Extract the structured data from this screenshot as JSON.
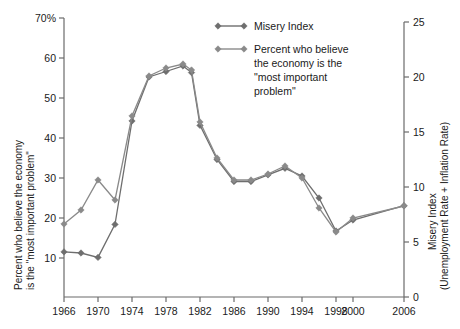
{
  "chart_data": {
    "type": "line",
    "title": "",
    "xlabel": "",
    "ylabel": "Percent who believe the economy is the \"most important problem\"",
    "y2label_line1": "Misery Index",
    "y2label_line2": "(Unemployment Rate + Inflation Rate)",
    "xlim": [
      1966,
      2006
    ],
    "ylim": [
      0,
      70
    ],
    "y2lim": [
      0,
      25
    ],
    "grid": false,
    "legend_position": "top-right",
    "x_ticks": [
      {
        "value": 1966,
        "label": "1966"
      },
      {
        "value": 1970,
        "label": "1970"
      },
      {
        "value": 1974,
        "label": "1974"
      },
      {
        "value": 1978,
        "label": "1978"
      },
      {
        "value": 1982,
        "label": "1982"
      },
      {
        "value": 1986,
        "label": "1986"
      },
      {
        "value": 1990,
        "label": "1990"
      },
      {
        "value": 1994,
        "label": "1994"
      },
      {
        "value": 1998,
        "label": "1998"
      },
      {
        "value": 2000,
        "label": "2000"
      },
      {
        "value": 2006,
        "label": "2006"
      }
    ],
    "y_ticks": [
      {
        "value": 10,
        "label": "10"
      },
      {
        "value": 20,
        "label": "20"
      },
      {
        "value": 30,
        "label": "30"
      },
      {
        "value": 40,
        "label": "40"
      },
      {
        "value": 50,
        "label": "50"
      },
      {
        "value": 60,
        "label": "60"
      },
      {
        "value": 70,
        "label": "70%"
      }
    ],
    "y2_ticks": [
      {
        "value": 0,
        "label": "0"
      },
      {
        "value": 5,
        "label": "5"
      },
      {
        "value": 10,
        "label": "10"
      },
      {
        "value": 15,
        "label": "15"
      },
      {
        "value": 20,
        "label": "20"
      },
      {
        "value": 25,
        "label": "25"
      }
    ],
    "series": [
      {
        "name": "Misery Index",
        "axis": "right",
        "color": "#6e6e6e",
        "marker": "diamond",
        "points": [
          {
            "x": 1966,
            "y": 4.1
          },
          {
            "x": 1968,
            "y": 4.0
          },
          {
            "x": 1970,
            "y": 3.6
          },
          {
            "x": 1972,
            "y": 6.6
          },
          {
            "x": 1974,
            "y": 16.0
          },
          {
            "x": 1976,
            "y": 20.0
          },
          {
            "x": 1978,
            "y": 20.5
          },
          {
            "x": 1980,
            "y": 21.0
          },
          {
            "x": 1981,
            "y": 20.4
          },
          {
            "x": 1982,
            "y": 15.6
          },
          {
            "x": 1984,
            "y": 12.5
          },
          {
            "x": 1986,
            "y": 10.5
          },
          {
            "x": 1988,
            "y": 10.5
          },
          {
            "x": 1990,
            "y": 11.1
          },
          {
            "x": 1992,
            "y": 11.7
          },
          {
            "x": 1994,
            "y": 11.0
          },
          {
            "x": 1996,
            "y": 9.0
          },
          {
            "x": 1998,
            "y": 6.0
          },
          {
            "x": 2000,
            "y": 7.0
          },
          {
            "x": 2006,
            "y": 8.3
          }
        ]
      },
      {
        "name": "Percent who believe the economy is the \"most important problem\"",
        "axis": "left",
        "color": "#8a8a8a",
        "marker": "diamond",
        "points": [
          {
            "x": 1966,
            "y": 18.5
          },
          {
            "x": 1968,
            "y": 22.0
          },
          {
            "x": 1970,
            "y": 29.5
          },
          {
            "x": 1972,
            "y": 24.5
          },
          {
            "x": 1974,
            "y": 45.5
          },
          {
            "x": 1976,
            "y": 55.5
          },
          {
            "x": 1978,
            "y": 57.5
          },
          {
            "x": 1980,
            "y": 58.5
          },
          {
            "x": 1981,
            "y": 57.0
          },
          {
            "x": 1982,
            "y": 44.0
          },
          {
            "x": 1984,
            "y": 35.0
          },
          {
            "x": 1986,
            "y": 29.5
          },
          {
            "x": 1988,
            "y": 29.5
          },
          {
            "x": 1990,
            "y": 31.0
          },
          {
            "x": 1992,
            "y": 33.0
          },
          {
            "x": 1994,
            "y": 30.0
          },
          {
            "x": 1996,
            "y": 22.5
          },
          {
            "x": 1998,
            "y": 16.5
          },
          {
            "x": 2000,
            "y": 20.0
          },
          {
            "x": 2006,
            "y": 23.0
          }
        ]
      }
    ],
    "inner_points": {
      "misery_secondary": [
        {
          "x": 1974,
          "y": 17.5
        },
        {
          "x": 1976,
          "y": 14.5
        },
        {
          "x": 1978,
          "y": 14.8
        }
      ]
    }
  },
  "legend": {
    "items": [
      {
        "label": "Misery Index"
      },
      {
        "label": "Percent who believe"
      },
      {
        "label": "the economy is the"
      },
      {
        "label": "\"most important"
      },
      {
        "label": "problem\""
      }
    ]
  },
  "axis_titles": {
    "left_line1": "Percent who believe the economy",
    "left_line2": "is the \"most important problem\"",
    "right_line1": "Misery Index",
    "right_line2": "(Unemployment Rate + Inflation Rate)"
  },
  "colors": {
    "series_misery": "#6e6e6e",
    "series_percent": "#8a8a8a",
    "axis": "#6b6b6b",
    "text": "#1a1a1a",
    "background": "#ffffff"
  }
}
